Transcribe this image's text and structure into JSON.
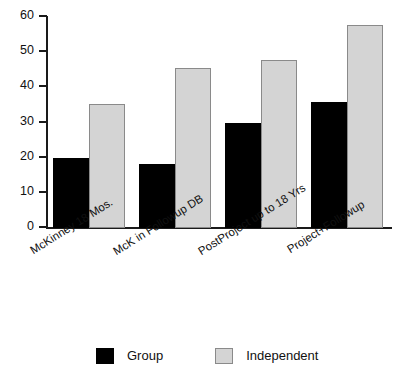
{
  "chart_data": {
    "type": "bar",
    "title": "",
    "subtitle": "",
    "xlabel": "",
    "ylabel": "",
    "ylim": [
      0,
      60
    ],
    "yticks": [
      0,
      10,
      20,
      30,
      40,
      50,
      60
    ],
    "ytick_labels": [
      "0",
      "10",
      "20",
      "30",
      "40",
      "50",
      "60"
    ],
    "grid": false,
    "legend_position": "bottom",
    "categories": [
      "McKinney 18 Mos.",
      "McK in Followup DB",
      "PostProject up to 18 Yrs",
      "Project+Followup"
    ],
    "series": [
      {
        "name": "Group",
        "color": "#000000",
        "values": [
          19.8,
          18.2,
          29.8,
          35.8
        ]
      },
      {
        "name": "Independent",
        "color": "#d4d4d4",
        "values": [
          35.4,
          45.6,
          47.8,
          57.8
        ]
      }
    ]
  },
  "legend": {
    "entries": [
      {
        "label": "Group",
        "swatch": "black-square-swatch"
      },
      {
        "label": "Independent",
        "swatch": "gray-square-swatch"
      }
    ]
  }
}
